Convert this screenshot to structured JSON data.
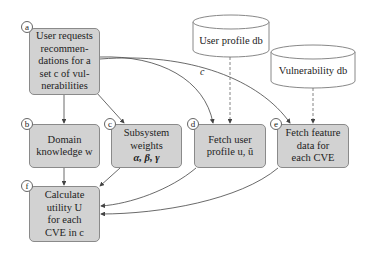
{
  "nodes": {
    "a": {
      "tag": "a",
      "lines": [
        "User requests",
        "recommen-",
        "dations for a",
        "set c of vul-",
        "nerabilities"
      ]
    },
    "b": {
      "tag": "b",
      "lines": [
        "Domain",
        "knowledge w"
      ]
    },
    "c": {
      "tag": "c",
      "lines": [
        "Subsystem",
        "weights",
        "α, β, γ"
      ]
    },
    "d": {
      "tag": "d",
      "lines": [
        "Fetch user",
        "profile u, û"
      ]
    },
    "e": {
      "tag": "e",
      "lines": [
        "Fetch feature",
        "data for",
        "each CVE"
      ]
    },
    "f": {
      "tag": "f",
      "lines": [
        "Calculate",
        "utility U",
        "for each",
        "CVE in c"
      ]
    }
  },
  "databases": {
    "user_profile": {
      "label": "User profile db"
    },
    "vulnerability": {
      "label": "Vulnerability db"
    }
  },
  "edge_labels": {
    "a_to_de": "c"
  },
  "colors": {
    "box_fill": "#d2d2d2",
    "box_border": "#8a8a8a",
    "edge": "#444444",
    "db_fill": "#ffffff"
  }
}
